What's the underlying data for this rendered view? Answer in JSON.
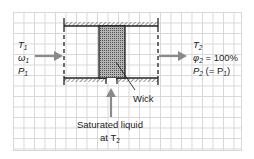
{
  "diagram": {
    "inlet": {
      "lines": [
        "T",
        "ω",
        "P"
      ],
      "subscript": "1"
    },
    "outlet": {
      "t_label": "T",
      "t_sub": "2",
      "phi_label": "φ",
      "phi_sub": "2",
      "phi_value": " = 100%",
      "p_label": "P",
      "p_sub": "2",
      "p_value_prefix": " (= P",
      "p_value_sub": "1",
      "p_value_suffix": ")"
    },
    "wick_label": "Wick",
    "liquid_label_line1": "Saturated liquid",
    "liquid_label_line2_prefix": "at T",
    "liquid_label_line2_sub": "2",
    "colors": {
      "arrow": "#8a8a8a",
      "line": "#222222",
      "grid": "#d8d8d8",
      "wick": "#9a9a9a"
    }
  }
}
